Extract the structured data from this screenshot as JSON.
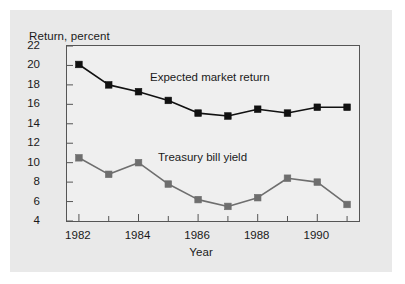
{
  "chart_data": {
    "type": "line",
    "title": "",
    "xlabel": "Year",
    "ylabel": "Return, percent",
    "x": [
      1982,
      1983,
      1984,
      1985,
      1986,
      1987,
      1988,
      1989,
      1990,
      1991
    ],
    "xlim": [
      1981.6,
      1991.4
    ],
    "ylim": [
      4,
      22
    ],
    "xticks_major": [
      1982,
      1984,
      1986,
      1988,
      1990
    ],
    "xticks_minor": [
      1983,
      1985,
      1987,
      1989,
      1991
    ],
    "yticks": [
      4,
      6,
      8,
      10,
      12,
      14,
      16,
      18,
      20,
      22
    ],
    "grid": false,
    "legend_position": "inline-annotation",
    "series": [
      {
        "name": "Expected market return",
        "color": "#111111",
        "marker": "square",
        "values": [
          20.1,
          18.0,
          17.3,
          16.4,
          15.1,
          14.8,
          15.5,
          15.1,
          15.7,
          15.7
        ]
      },
      {
        "name": "Treasury bill yield",
        "color": "#6e6e6e",
        "marker": "square",
        "values": [
          10.5,
          8.8,
          10.0,
          7.8,
          6.2,
          5.5,
          6.4,
          8.4,
          8.0,
          5.7
        ]
      }
    ],
    "annotations": [
      {
        "text": "Expected market return",
        "series": "Expected market return"
      },
      {
        "text": "Treasury bill yield",
        "series": "Treasury bill yield"
      }
    ]
  },
  "axis": {
    "ylabel_text": "Return, percent",
    "xlabel_text": "Year",
    "ytick_labels": [
      "22",
      "20",
      "18",
      "16",
      "14",
      "12",
      "10",
      "8",
      "6",
      "4"
    ],
    "xtick_labels": [
      "1982",
      "1984",
      "1986",
      "1988",
      "1990"
    ]
  },
  "labels": {
    "expected_market_return": "Expected market return",
    "treasury_bill_yield": "Treasury bill yield"
  },
  "colors": {
    "page_background": "#ffffff",
    "card_background": "#e9e9e9",
    "plot_background": "#efefef",
    "frame": "#555555",
    "series_expected": "#111111",
    "series_treasury": "#6e6e6e",
    "text": "#1a1a1a"
  }
}
